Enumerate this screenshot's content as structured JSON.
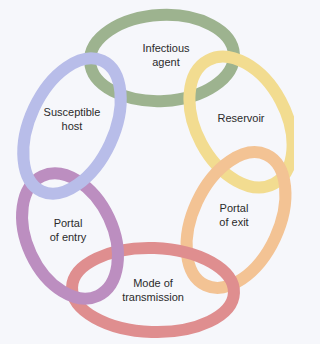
{
  "diagram": {
    "type": "chain-of-infection",
    "background": "#f6f7fb",
    "links": [
      {
        "id": "infectious-agent",
        "label": "Infectious\nagent",
        "color": "#9db38f",
        "cx": 162,
        "cy": 58,
        "rx": 72,
        "ry": 43,
        "rot": -3,
        "lx": 166,
        "ly": 55
      },
      {
        "id": "reservoir",
        "label": "Reservoir",
        "color": "#f2dc90",
        "cx": 241,
        "cy": 122,
        "rx": 45,
        "ry": 70,
        "rot": -28,
        "lx": 241,
        "ly": 118
      },
      {
        "id": "portal-of-exit",
        "label": "Portal\nof exit",
        "color": "#f3c394",
        "cx": 236,
        "cy": 220,
        "rx": 43,
        "ry": 72,
        "rot": 25,
        "lx": 234,
        "ly": 215
      },
      {
        "id": "mode-of-transmission",
        "label": "Mode of\ntransmission",
        "color": "#df8e8f",
        "cx": 153,
        "cy": 290,
        "rx": 81,
        "ry": 42,
        "rot": 2,
        "lx": 153,
        "ly": 290
      },
      {
        "id": "portal-of-entry",
        "label": "Portal\nof entry",
        "color": "#bc8ec0",
        "cx": 70,
        "cy": 236,
        "rx": 43,
        "ry": 66,
        "rot": -25,
        "lx": 68,
        "ly": 230
      },
      {
        "id": "susceptible-host",
        "label": "Susceptible\nhost",
        "color": "#b8bde9",
        "cx": 72,
        "cy": 126,
        "rx": 42,
        "ry": 72,
        "rot": 25,
        "lx": 72,
        "ly": 119
      }
    ],
    "stroke_width": 12
  }
}
